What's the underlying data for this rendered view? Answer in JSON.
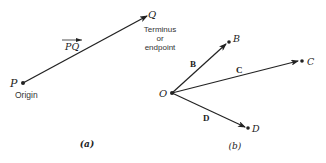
{
  "panel_a": {
    "caption": "(a)",
    "vector_label": "PQ",
    "origin_point": "P",
    "origin_label": "Origin",
    "terminus_point": "Q",
    "terminus_label_lines": [
      "Terminus",
      "or",
      "endpoint"
    ]
  },
  "panel_b": {
    "caption": "(b)",
    "common_origin": "O",
    "vectors": [
      {
        "name": "B",
        "endpoint": "B"
      },
      {
        "name": "C",
        "endpoint": "C"
      },
      {
        "name": "D",
        "endpoint": "D"
      }
    ]
  },
  "colors": {
    "ink": "#222222",
    "background": "#ffffff"
  }
}
